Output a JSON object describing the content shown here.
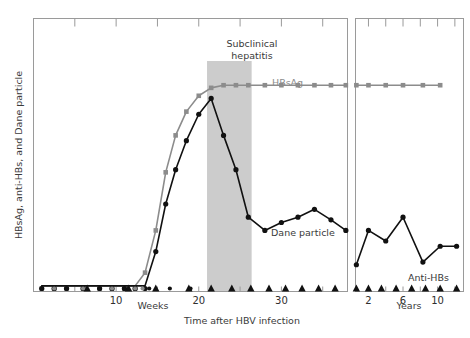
{
  "chart_data": {
    "type": "line",
    "title": "",
    "xlabel": "Time after HBV infection",
    "ylabel": "HBsAg, anti-HBs, and Dane particle",
    "grid": false,
    "legend": "inline-annotations",
    "panels": [
      {
        "name": "weeks-panel",
        "xlabel": "Weeks",
        "xlim": [
          0,
          38
        ],
        "ticks": [
          10,
          20,
          30
        ],
        "tick_labels": [
          "10",
          "20",
          "30"
        ],
        "minor_ticks": [
          5,
          15,
          25,
          35
        ],
        "ylim": [
          0,
          100
        ]
      },
      {
        "name": "years-panel",
        "xlabel": "Years",
        "xlim": [
          0.5,
          13
        ],
        "ticks": [
          2,
          6,
          10
        ],
        "tick_labels": [
          "2",
          "6",
          "10"
        ],
        "minor_ticks": [
          4,
          8,
          12
        ],
        "ylim": [
          0,
          100
        ]
      }
    ],
    "series": [
      {
        "name": "HBsAg",
        "label": "HBsAg",
        "color": "#8c8c8c",
        "marker": "square",
        "panel": "weeks-panel",
        "x": [
          1.0,
          2.5,
          4.0,
          6.0,
          8.0,
          9.5,
          11.0,
          12.3,
          13.5,
          14.8,
          16.0,
          17.2,
          18.5,
          20.0,
          21.5,
          23.0,
          24.5,
          26.0,
          28.0,
          30.0,
          32.0,
          34.0,
          36.0,
          37.8
        ],
        "y": [
          1,
          1,
          1,
          1,
          1,
          1,
          1,
          1,
          6,
          22,
          44,
          58,
          67,
          73,
          76,
          77,
          77,
          77,
          77,
          77,
          77,
          77,
          77,
          77
        ],
        "note": "rises sharply at week 13, plateaus high through week 38"
      },
      {
        "name": "HBsAg-continued",
        "label": "HBsAg",
        "color": "#8c8c8c",
        "marker": "square",
        "panel": "years-panel",
        "x": [
          0.6,
          2.0,
          4.0,
          6.0,
          8.3,
          10.3
        ],
        "y": [
          77,
          77,
          77,
          77,
          77,
          77
        ],
        "note": "plateau persists through years panel"
      },
      {
        "name": "Dane particle",
        "label": "Dane particle",
        "color": "#111111",
        "marker": "circle",
        "panel": "weeks-panel",
        "x": [
          1.0,
          2.5,
          4.0,
          6.0,
          8.0,
          9.5,
          11.0,
          12.3,
          13.5,
          14.8,
          16.0,
          17.2,
          18.5,
          20.0,
          21.5,
          23.0,
          24.5,
          26.0,
          28.0,
          30.0,
          32.0,
          34.0,
          36.0,
          37.8
        ],
        "y": [
          1,
          1,
          1,
          1,
          1,
          1,
          1,
          1,
          1,
          14,
          32,
          45,
          56,
          66,
          72,
          58,
          45,
          27,
          22,
          25,
          27,
          30,
          26,
          22
        ],
        "note": "peaks at week 21.5 then declines to low plateau"
      },
      {
        "name": "Dane particle-continued",
        "label": "Dane particle",
        "color": "#111111",
        "marker": "circle",
        "panel": "years-panel",
        "x": [
          0.6,
          2.0,
          4.0,
          6.0,
          8.3,
          10.3,
          12.2
        ],
        "y": [
          9,
          22,
          18,
          27,
          10,
          16,
          16
        ],
        "note": "low fluctuating level over years"
      },
      {
        "name": "Anti-HBs",
        "label": "Anti-HBs",
        "color": "#111111",
        "marker": "triangle",
        "panel": "weeks-panel",
        "x": [
          6.5,
          11.5,
          14.8,
          18.8,
          21.5,
          24.0,
          26.3,
          28.5,
          30.5,
          32.5,
          34.5,
          36.5
        ],
        "y": [
          0,
          0,
          0,
          0,
          0,
          0,
          0,
          0,
          0,
          0,
          0,
          0
        ],
        "note": "remains at baseline zero throughout weeks panel"
      },
      {
        "name": "Anti-HBs-continued",
        "label": "Anti-HBs",
        "color": "#111111",
        "marker": "triangle",
        "panel": "years-panel",
        "x": [
          0.6,
          2.0,
          3.5,
          5.2,
          7.0,
          8.6,
          10.3,
          12.2
        ],
        "y": [
          0,
          0,
          0,
          0,
          0,
          0,
          0,
          0
        ],
        "note": "remains at baseline zero throughout years panel"
      },
      {
        "name": "baseline-gray-markers",
        "label": "HBsAg baseline",
        "color": "#8c8c8c",
        "marker": "circle",
        "panel": "weeks-panel",
        "x": [
          2.5,
          6.0,
          9.5,
          12.3,
          13.2
        ],
        "y": [
          0,
          0,
          0,
          0,
          0
        ],
        "note": "small gray baseline points before HBsAg rise"
      },
      {
        "name": "baseline-black-markers",
        "label": "Dane particle baseline",
        "color": "#111111",
        "marker": "circle",
        "panel": "weeks-panel",
        "x": [
          1.0,
          4.0,
          8.0,
          11.0,
          14.0,
          16.5,
          19.0
        ],
        "y": [
          0,
          0,
          0,
          0,
          0,
          0,
          0
        ],
        "note": "small black baseline points before Dane particle rise"
      }
    ],
    "shaded_region": {
      "label": "Subclinical hepatitis",
      "color": "#cccccc",
      "panel": "weeks-panel",
      "x_start": 21.0,
      "x_end": 26.4
    },
    "annotations": [
      {
        "text": "Subclinical",
        "name": "subclinical-label"
      },
      {
        "text": "hepatitis",
        "name": "hepatitis-label"
      },
      {
        "text": "HBsAg",
        "name": "hbsag-label"
      },
      {
        "text": "Dane particle",
        "name": "dane-particle-label"
      },
      {
        "text": "Anti-HBs",
        "name": "anti-hbs-label"
      }
    ]
  },
  "axes": {
    "y_label": "HBsAg, anti-HBs, and Dane particle",
    "x_label_main": "Time after HBV infection",
    "weeks_label": "Weeks",
    "years_label": "Years",
    "weeks_ticks": [
      "10",
      "20",
      "30"
    ],
    "years_ticks": [
      "2",
      "6",
      "10"
    ]
  },
  "colors": {
    "frame": "#9a9a9a",
    "gray_series": "#8c8c8c",
    "black_series": "#111111",
    "shaded_band": "#cccccc",
    "background": "#ffffff",
    "text": "#3a3a3a"
  }
}
